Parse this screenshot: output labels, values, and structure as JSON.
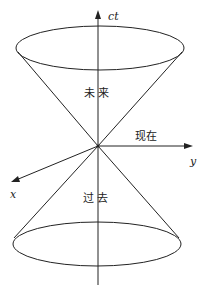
{
  "diagram": {
    "type": "light-cone",
    "axes": {
      "time": "ct",
      "y": "y",
      "x": "x"
    },
    "regions": {
      "future": "未 来",
      "present": "现在",
      "past": "过 去"
    },
    "colors": {
      "stroke": "#222222",
      "background": "#ffffff"
    }
  }
}
